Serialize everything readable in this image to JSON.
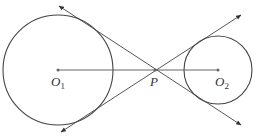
{
  "diagram": {
    "stroke_color": "#444444",
    "circles": [
      {
        "name": "O1",
        "cx": 58,
        "cy": 70,
        "r": 55
      },
      {
        "name": "O2",
        "cx": 218,
        "cy": 70,
        "r": 34
      }
    ],
    "points": {
      "O1": {
        "x": 58,
        "y": 70
      },
      "P": {
        "x": 155,
        "y": 70
      },
      "O2": {
        "x": 218,
        "y": 70
      }
    },
    "lines": [
      {
        "name": "tangent-1",
        "x1": 59,
        "y1": 6,
        "x2": 241,
        "y2": 125
      },
      {
        "name": "tangent-2",
        "x1": 61,
        "y1": 132,
        "x2": 241,
        "y2": 15
      }
    ],
    "segment": {
      "name": "O1O2",
      "x1": 58,
      "y1": 70,
      "x2": 218,
      "y2": 70
    },
    "labels": {
      "o1_main": "O",
      "o1_sub": "1",
      "p": "P",
      "o2_main": "O",
      "o2_sub": "2"
    }
  }
}
